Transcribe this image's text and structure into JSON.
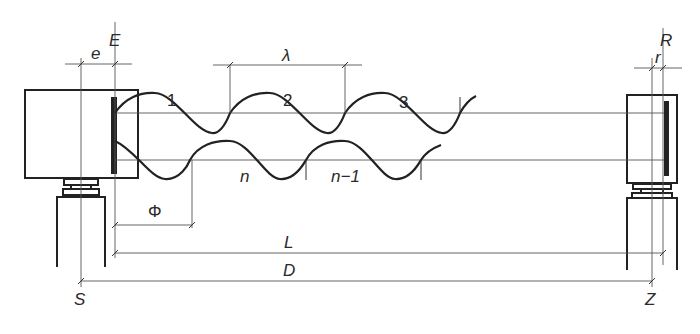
{
  "diagram": {
    "labels": {
      "emitter": "E",
      "station": "S",
      "reflector": "R",
      "target": "Z",
      "emitter_offset": "e",
      "reflector_offset": "r",
      "wavelength": "λ",
      "phase": "Φ",
      "distance_L": "L",
      "distance_D": "D"
    },
    "outgoing_wave_cycles": [
      "1",
      "2",
      "3"
    ],
    "return_wave_cycles": [
      "n",
      "n−1"
    ],
    "colors": {
      "line": "#222222",
      "thin_line": "#555555",
      "background": "#ffffff"
    }
  }
}
